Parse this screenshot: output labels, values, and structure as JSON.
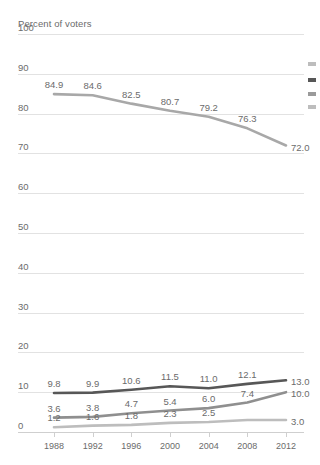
{
  "chart_data": {
    "type": "line",
    "title": "",
    "ylabel": "Percent of voters",
    "xlabel": "",
    "ylim": [
      0,
      100
    ],
    "yticks": [
      0,
      10,
      20,
      30,
      40,
      50,
      60,
      70,
      80,
      90,
      100
    ],
    "grid": true,
    "legend": "right-edge-swatches",
    "categories": [
      "1988",
      "1992",
      "1996",
      "2000",
      "2004",
      "2008",
      "2012"
    ],
    "series": [
      {
        "name": "series-1",
        "color": "#a8a8a8",
        "values": [
          84.9,
          84.6,
          82.5,
          80.7,
          79.2,
          76.3,
          72.0
        ],
        "labels": [
          "84.9",
          "84.6",
          "82.5",
          "80.7",
          "79.2",
          "76.3",
          "72.0"
        ]
      },
      {
        "name": "series-2",
        "color": "#575757",
        "values": [
          9.8,
          9.9,
          10.6,
          11.5,
          11.0,
          12.1,
          13.0
        ],
        "labels": [
          "9.8",
          "9.9",
          "10.6",
          "11.5",
          "11.0",
          "12.1",
          "13.0"
        ]
      },
      {
        "name": "series-3",
        "color": "#8f8f8f",
        "values": [
          3.6,
          3.8,
          4.7,
          5.4,
          6.0,
          7.4,
          10.0
        ],
        "labels": [
          "3.6",
          "3.8",
          "4.7",
          "5.4",
          "6.0",
          "7.4",
          "10.0"
        ]
      },
      {
        "name": "series-4",
        "color": "#bdbdbd",
        "values": [
          1.2,
          1.6,
          1.8,
          2.3,
          2.5,
          3.0,
          3.0
        ],
        "labels": [
          "1.2",
          "1.6",
          "1.8",
          "2.3",
          "2.5",
          "",
          "3.0"
        ]
      }
    ],
    "legend_swatches": [
      {
        "name": "legend-swatch-1",
        "color": "#bdbdbd"
      },
      {
        "name": "legend-swatch-2",
        "color": "#575757"
      },
      {
        "name": "legend-swatch-3",
        "color": "#9a9a9a"
      },
      {
        "name": "legend-swatch-4",
        "color": "#bdbdbd"
      }
    ]
  }
}
